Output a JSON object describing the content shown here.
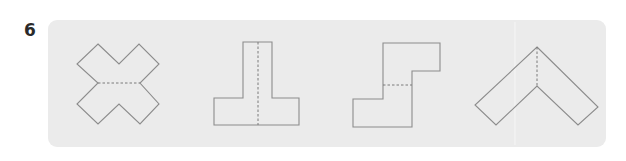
{
  "question": {
    "number": "6"
  },
  "panel": {
    "background": "#ebebeb",
    "line_color": "#8c8c8c"
  },
  "options": [
    {
      "id": "shape-1",
      "description": "cross / X-shaped net with a horizontal dashed fold line"
    },
    {
      "id": "shape-2",
      "description": "inverted T-shaped net with a vertical dashed fold line"
    },
    {
      "id": "shape-3",
      "description": "S-step shaped net with a horizontal dashed fold line"
    },
    {
      "id": "shape-4",
      "description": "chevron / inverted V-shaped net with a vertical dashed fold line"
    }
  ]
}
